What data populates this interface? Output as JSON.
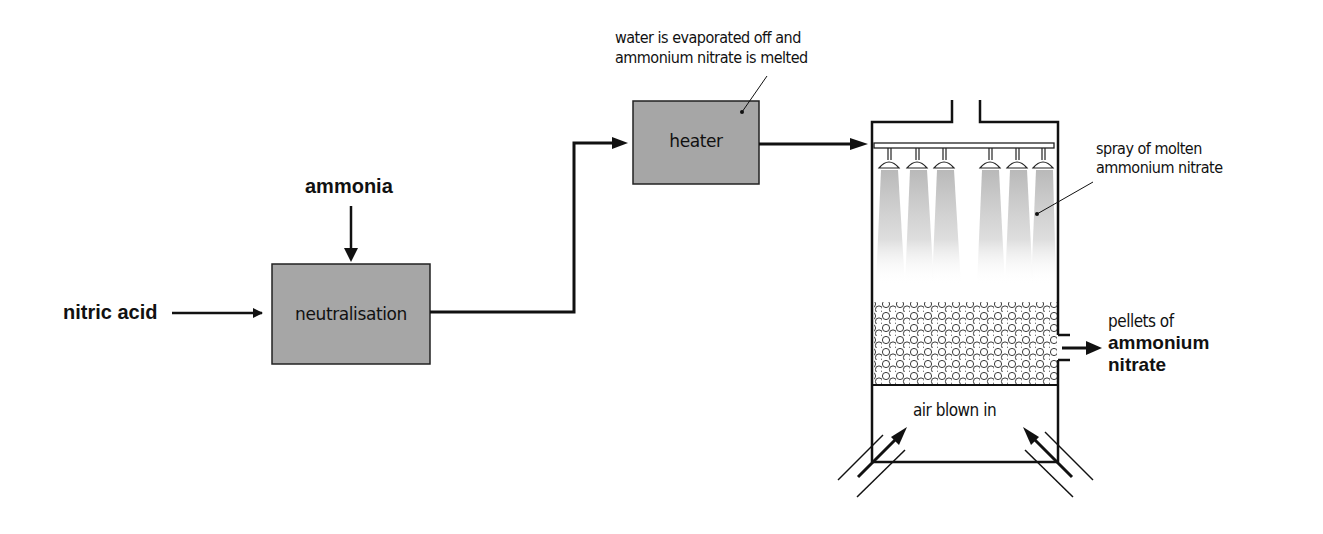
{
  "diagram": {
    "inputs": {
      "nitric_acid": "nitric acid",
      "ammonia": "ammonia"
    },
    "stages": {
      "neutralisation": "neutralisation",
      "heater": "heater"
    },
    "annotations": {
      "heater_note_line1": "water is evaporated off and",
      "heater_note_line2": "ammonium nitrate is melted",
      "spray_line1": "spray of molten",
      "spray_line2": "ammonium nitrate",
      "air": "air blown in",
      "product_line1": "pellets of",
      "product_line2": "ammonium",
      "product_line3": "nitrate"
    },
    "colors": {
      "box_fill": "#a6a6a6",
      "line": "#111111",
      "spray": "#bdbdbd"
    },
    "nozzle_count": 6
  }
}
